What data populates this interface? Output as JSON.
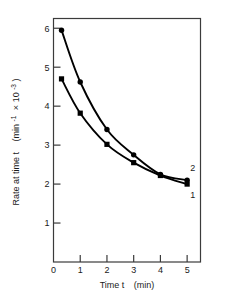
{
  "chart_data": {
    "type": "line",
    "title": "",
    "xlabel": "Time t  (min)",
    "ylabel": "Rate at time t   (min⁻¹ × 10⁻³)",
    "xlim": [
      0,
      5.5
    ],
    "ylim": [
      0,
      6.25
    ],
    "grid": false,
    "legend": "inline-curve-labels",
    "x_ticks": [
      "0",
      "1",
      "2",
      "3",
      "4",
      "5"
    ],
    "x_tick_values": [
      0,
      1,
      2,
      3,
      4,
      5
    ],
    "y_ticks": [
      "1",
      "2",
      "3",
      "4",
      "5",
      "6"
    ],
    "y_tick_values": [
      1,
      2,
      3,
      4,
      5,
      6
    ],
    "series": [
      {
        "name": "2",
        "label": "2",
        "marker": "filled-circle",
        "color": "#000000",
        "x": [
          0.3,
          1.0,
          2.0,
          3.0,
          4.0,
          5.0
        ],
        "values": [
          5.95,
          4.62,
          3.4,
          2.75,
          2.25,
          2.1
        ]
      },
      {
        "name": "1",
        "label": "1",
        "marker": "filled-square",
        "color": "#000000",
        "x": [
          0.3,
          1.0,
          2.0,
          3.0,
          4.0,
          5.0
        ],
        "values": [
          4.7,
          3.82,
          3.02,
          2.55,
          2.22,
          2.0
        ]
      }
    ]
  },
  "axis_title_parts": {
    "y_main": "Rate at time t",
    "y_units_open": "(min",
    "y_units_exp1": "-1",
    "y_units_mid": "× 10",
    "y_units_exp2": "-3",
    "y_units_close": ")",
    "x_main": "Time t",
    "x_units": "(min)"
  },
  "colors": {
    "frame": "#3b3b3b",
    "curve": "#000000",
    "text": "#1a1a1a",
    "background": "#ffffff"
  }
}
